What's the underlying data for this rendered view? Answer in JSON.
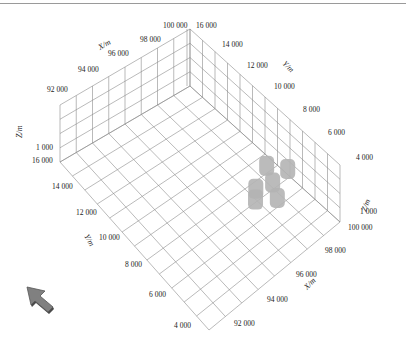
{
  "chart_data": {
    "type": "scatter3d",
    "title": "",
    "axes": {
      "x": {
        "label": "X/m",
        "ticks": [
          "92 000",
          "94 000",
          "96 000",
          "98 000",
          "100 000"
        ],
        "range": [
          92000,
          100000
        ]
      },
      "y": {
        "label": "Y/m",
        "ticks": [
          "4 000",
          "6 000",
          "8 000",
          "10 000",
          "12 000",
          "14 000",
          "16 000"
        ],
        "range": [
          4000,
          16000
        ]
      },
      "z": {
        "label": "Z/m",
        "ticks": [
          "1 000"
        ]
      }
    },
    "grid": true,
    "series": [
      {
        "name": "bodies",
        "color": "#b4b4b4",
        "points": [
          {
            "x": 99000,
            "y": 8600,
            "label": "body-1"
          },
          {
            "x": 99600,
            "y": 7700,
            "label": "body-2"
          },
          {
            "x": 98600,
            "y": 7600,
            "label": "body-3"
          },
          {
            "x": 97800,
            "y": 7900,
            "label": "body-4"
          },
          {
            "x": 98200,
            "y": 6700,
            "label": "body-5"
          },
          {
            "x": 97400,
            "y": 7400,
            "label": "body-6"
          }
        ]
      }
    ]
  },
  "labels": {
    "x_axis_back": {
      "title": "X/m",
      "ticks": [
        "92 000",
        "94 000",
        "96 000",
        "98 000",
        "100 000"
      ]
    },
    "y_axis_back": {
      "title": "Y/m",
      "ticks": [
        "16 000",
        "14 000",
        "12 000",
        "10 000",
        "8 000",
        "6 000",
        "4 000"
      ]
    },
    "z_axis_left": {
      "title": "Z/m",
      "tick": "1 000"
    },
    "y_axis_front": {
      "title": "Y/m",
      "ticks": [
        "16 000",
        "14 000",
        "12 000",
        "10 000",
        "8 000",
        "6 000",
        "4 000"
      ]
    },
    "x_axis_front": {
      "title": "X/m",
      "ticks": [
        "100 000",
        "98 000",
        "96 000",
        "94 000",
        "92 000"
      ]
    },
    "z_axis_right": {
      "title": "Z/m",
      "tick": "1 000"
    }
  },
  "colors": {
    "grid": "#8c8c8c",
    "bodies": "#b4b4b4",
    "arrow": "#808080"
  },
  "navigation": {
    "arrow_icon": "orientation-arrow"
  }
}
